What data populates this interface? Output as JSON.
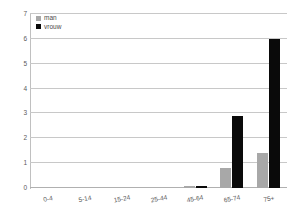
{
  "chart_data": {
    "type": "bar",
    "title": "",
    "xlabel": "",
    "ylabel": "",
    "categories": [
      "0-4",
      "5-14",
      "15-24",
      "25-44",
      "45-64",
      "65-74",
      "75+"
    ],
    "series": [
      {
        "name": "man",
        "color": "#a8a8a8",
        "values": [
          0,
          0,
          0,
          0,
          0.07,
          0.8,
          1.4
        ]
      },
      {
        "name": "vrouw",
        "color": "#0a0a0a",
        "values": [
          0,
          0,
          0,
          0,
          0.07,
          2.9,
          6.0
        ]
      }
    ],
    "ylim": [
      0,
      7
    ],
    "yticks": [
      0,
      1,
      2,
      3,
      4,
      5,
      6,
      7
    ],
    "ytick_labels": [
      "0",
      "1",
      "2",
      "3",
      "4",
      "5",
      "6",
      "7"
    ],
    "grid": true,
    "grid_axis": "y",
    "legend_position": "top-left",
    "legend": [
      {
        "label": "man",
        "color": "#a8a8a8"
      },
      {
        "label": "vrouw",
        "color": "#0a0a0a"
      }
    ]
  }
}
